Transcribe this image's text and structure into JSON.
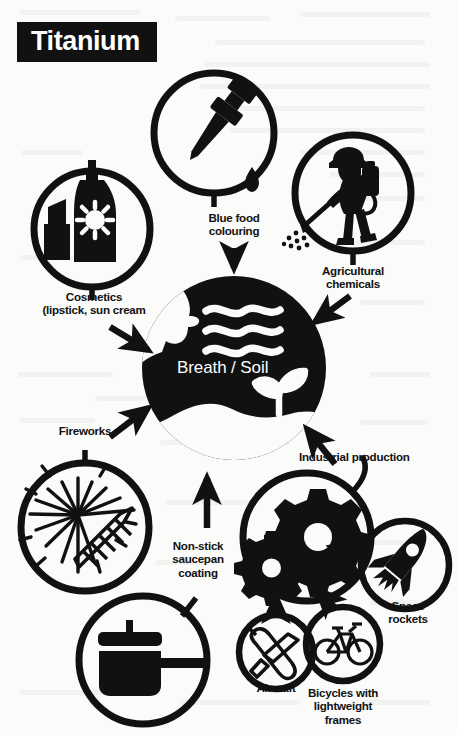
{
  "title": "Titanium",
  "center": {
    "label": "Breath / Soil",
    "icons": [
      "face-profile-breathing-icon",
      "breath-waves-icon",
      "plant-sprout-icon"
    ]
  },
  "colors": {
    "ink": "#111111",
    "paper": "#fbfbf9",
    "center_fill": "#111111",
    "center_text": "#ffffff"
  },
  "nodes": [
    {
      "id": "blue-food-colouring",
      "label": "Blue food\ncolouring",
      "icon": "dropper-pipette-icon",
      "arrow": "down-into-center"
    },
    {
      "id": "agricultural-chemicals",
      "label": "Agricultural\nchemicals",
      "icon": "farmer-spraying-backpack-icon",
      "arrow": "down-left-into-center"
    },
    {
      "id": "cosmetics",
      "label": "Cosmetics\n(lipstick, sun cream",
      "icon": "lipstick-and-suncream-bottle-icon",
      "arrow": "down-right-into-center"
    },
    {
      "id": "fireworks",
      "label": "Fireworks",
      "icon": "firework-burst-icon",
      "arrow": "up-right-into-center"
    },
    {
      "id": "non-stick-saucepan-coating",
      "label": "Non-stick\nsaucepan\ncoating",
      "icon": "saucepan-with-lid-icon",
      "arrow": "up-into-center"
    },
    {
      "id": "industrial-production",
      "label": "Industrial production",
      "icon": "gears-cogs-icon",
      "arrow": "up-left-into-center"
    },
    {
      "id": "space-rockets",
      "label": "Space\nrockets",
      "icon": "rocket-icon",
      "arrow": "left-into-industrial-production"
    },
    {
      "id": "aircraft",
      "label": "Aircraft",
      "icon": "airplane-icon",
      "arrow": "up-into-industrial-production"
    },
    {
      "id": "bicycles",
      "label": "Bicycles with\nlightweight\nframes",
      "icon": "bicycle-icon",
      "arrow": "up-left-into-industrial-production"
    }
  ]
}
